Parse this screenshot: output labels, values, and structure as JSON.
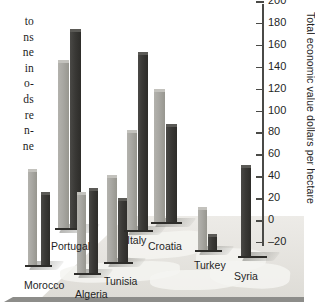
{
  "side_text": {
    "lines": [
      "to",
      "ns",
      "ne",
      "in",
      "o-",
      "ds",
      "re",
      "n-",
      "ne"
    ]
  },
  "chart_data": {
    "type": "bar",
    "title": "",
    "subtitle": "",
    "xlabel": "",
    "ylabel": "Total economic value dollars per hectare",
    "ylim": [
      -20,
      200
    ],
    "yticks": [
      -20,
      0,
      20,
      40,
      60,
      80,
      100,
      120,
      140,
      160,
      180,
      200
    ],
    "ytick_labels": [
      "–20",
      "0",
      "20",
      "40",
      "60",
      "80",
      "100",
      "120",
      "140",
      "160",
      "180",
      "200"
    ],
    "grid": false,
    "legend_position": "none",
    "projection": "3d-perspective-map",
    "categories": [
      "Morocco",
      "Portugal",
      "Algeria",
      "Tunisia",
      "Italy",
      "Croatia",
      "Turkey",
      "Syria"
    ],
    "series": [
      {
        "name": "light-bar",
        "color": "#a8a7a2",
        "values": [
          45,
          144,
          24,
          39,
          80,
          118,
          10,
          null
        ]
      },
      {
        "name": "dark-bar",
        "color": "#33322f",
        "values": [
          24,
          173,
          27,
          18,
          152,
          86,
          -15,
          48
        ]
      }
    ],
    "annotations": [
      {
        "label": "Morocco",
        "x_px": 24,
        "y_px": 279
      },
      {
        "label": "Portugal",
        "x_px": 51,
        "y_px": 240
      },
      {
        "label": "Algeria",
        "x_px": 75,
        "y_px": 288
      },
      {
        "label": "Tunisia",
        "x_px": 104,
        "y_px": 275
      },
      {
        "label": "Italy",
        "x_px": 127,
        "y_px": 234
      },
      {
        "label": "Croatia",
        "x_px": 148,
        "y_px": 240
      },
      {
        "label": "Turkey",
        "x_px": 194,
        "y_px": 259
      },
      {
        "label": "Syria",
        "x_px": 234,
        "y_px": 270
      }
    ]
  },
  "axis": {
    "title": "Total economic value dollars per hectare"
  },
  "colors": {
    "light_bar": "#a8a7a2",
    "dark_bar": "#33322f",
    "ground": "#e3e1dc",
    "axis": "#4a4a47",
    "text": "#1f1f1f"
  }
}
